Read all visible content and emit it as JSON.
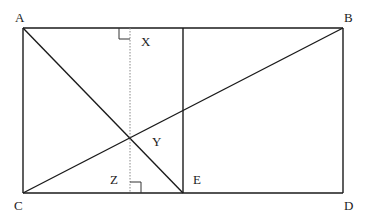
{
  "diagram": {
    "type": "geometry",
    "points": {
      "A": {
        "label": "A",
        "x": 23,
        "y": 28
      },
      "B": {
        "label": "B",
        "x": 343,
        "y": 28
      },
      "C": {
        "label": "C",
        "x": 23,
        "y": 193
      },
      "D": {
        "label": "D",
        "x": 343,
        "y": 193
      },
      "E": {
        "label": "E",
        "x": 183,
        "y": 193
      },
      "X": {
        "label": "X",
        "x": 130,
        "y": 28
      },
      "Y": {
        "label": "Y",
        "x": 130,
        "y": 138
      },
      "Z": {
        "label": "Z",
        "x": 130,
        "y": 193
      }
    },
    "labels": {
      "A": "A",
      "B": "B",
      "C": "C",
      "D": "D",
      "E": "E",
      "X": "X",
      "Y": "Y",
      "Z": "Z"
    },
    "segments": [
      {
        "from": "A",
        "to": "B",
        "style": "solid"
      },
      {
        "from": "C",
        "to": "D",
        "style": "solid"
      },
      {
        "from": "A",
        "to": "C",
        "style": "solid"
      },
      {
        "from": "B",
        "to": "D",
        "style": "solid"
      },
      {
        "from": "E_top",
        "to": "E",
        "style": "solid"
      },
      {
        "from": "A",
        "to": "E",
        "style": "solid"
      },
      {
        "from": "C",
        "to": "B",
        "style": "solid"
      },
      {
        "from": "X",
        "to": "Z",
        "style": "dotted"
      }
    ],
    "right_angles": [
      "X",
      "Z"
    ],
    "colors": {
      "line": "#1a1a1a",
      "dotted": "#888888",
      "background": "#ffffff"
    }
  }
}
